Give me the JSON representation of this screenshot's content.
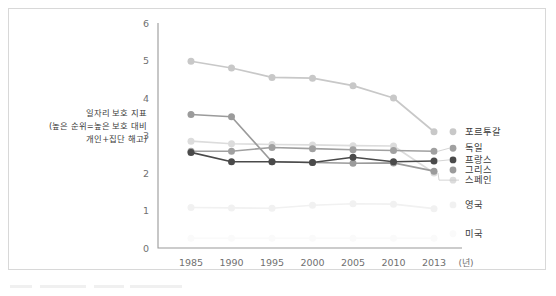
{
  "chart_data": {
    "type": "line",
    "title": "",
    "xlabel": "(년)",
    "ylabel": "일자리 보호 지표\n(높은 순위=높은 보호 대비\n개인+집단 해고)",
    "ylabel_lines": [
      "일자리 보호 지표",
      "(높은 순위=높은 보호 대비",
      "개인+집단 해고)"
    ],
    "categories": [
      "1985",
      "1990",
      "1995",
      "2000",
      "2005",
      "2010",
      "2013"
    ],
    "x": [
      1985,
      1990,
      1995,
      2000,
      2005,
      2010,
      2013
    ],
    "ylim": [
      0,
      6
    ],
    "yticks": [
      "0",
      "1",
      "2",
      "3",
      "4",
      "5",
      "6"
    ],
    "ytick_values": [
      0,
      1,
      2,
      3,
      4,
      5,
      6
    ],
    "grid": false,
    "legend_position": "right-inline",
    "series": [
      {
        "name": "포르투갈",
        "color": "#c8c8c8",
        "values": [
          4.98,
          4.8,
          4.55,
          4.53,
          4.33,
          4.0,
          3.1
        ]
      },
      {
        "name": "독일",
        "color": "#a0a0a0",
        "values": [
          2.58,
          2.58,
          2.68,
          2.65,
          2.62,
          2.6,
          2.58
        ]
      },
      {
        "name": "프랑스",
        "color": "#4a4a4a",
        "values": [
          2.55,
          2.3,
          2.3,
          2.28,
          2.42,
          2.3,
          2.32
        ]
      },
      {
        "name": "그리스",
        "color": "#9b9b9b",
        "values": [
          3.56,
          3.5,
          2.3,
          2.28,
          2.26,
          2.27,
          2.05
        ]
      },
      {
        "name": "스페인",
        "color": "#dcdcdc",
        "values": [
          2.85,
          2.78,
          2.76,
          2.75,
          2.73,
          2.72,
          2.0
        ]
      },
      {
        "name": "영국",
        "color": "#f1f1f1",
        "values": [
          1.08,
          1.07,
          1.06,
          1.14,
          1.18,
          1.17,
          1.05
        ]
      },
      {
        "name": "미국",
        "color": "#fafafa",
        "values": [
          0.26,
          0.26,
          0.26,
          0.26,
          0.26,
          0.26,
          0.26
        ]
      }
    ],
    "series_label_positions": [
      {
        "name": "포르투갈",
        "y_value": 3.02
      },
      {
        "name": "독일",
        "y_value": 2.58
      },
      {
        "name": "프랑스",
        "y_value": 2.27
      },
      {
        "name": "그리스",
        "y_value": 2.0
      },
      {
        "name": "스페인",
        "y_value": 1.73
      },
      {
        "name": "영국",
        "y_value": 1.07
      },
      {
        "name": "미국",
        "y_value": 0.3
      }
    ]
  }
}
